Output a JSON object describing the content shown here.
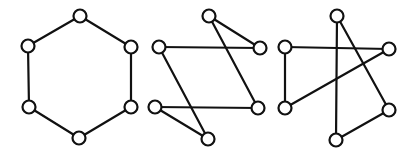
{
  "figure": {
    "colors": {
      "stroke": "#111111",
      "node_fill": "#ffffff",
      "background": "#ffffff"
    },
    "node_radius": 6.5,
    "graphs": [
      {
        "id": "hexagon",
        "nodes": [
          {
            "id": "a",
            "x": 80,
            "y": 16
          },
          {
            "id": "b",
            "x": 131,
            "y": 47
          },
          {
            "id": "c",
            "x": 131,
            "y": 107
          },
          {
            "id": "d",
            "x": 79,
            "y": 138
          },
          {
            "id": "e",
            "x": 29,
            "y": 107
          },
          {
            "id": "f",
            "x": 28,
            "y": 46
          }
        ],
        "edges": [
          [
            "a",
            "b"
          ],
          [
            "b",
            "c"
          ],
          [
            "c",
            "d"
          ],
          [
            "d",
            "e"
          ],
          [
            "e",
            "f"
          ],
          [
            "f",
            "a"
          ]
        ]
      },
      {
        "id": "crossed-1",
        "nodes": [
          {
            "id": "a",
            "x": 209,
            "y": 16
          },
          {
            "id": "b",
            "x": 260,
            "y": 48
          },
          {
            "id": "c",
            "x": 258,
            "y": 108
          },
          {
            "id": "d",
            "x": 208,
            "y": 139
          },
          {
            "id": "e",
            "x": 155,
            "y": 107
          },
          {
            "id": "f",
            "x": 159,
            "y": 47
          }
        ],
        "edges": [
          [
            "a",
            "b"
          ],
          [
            "b",
            "f"
          ],
          [
            "f",
            "d"
          ],
          [
            "d",
            "e"
          ],
          [
            "e",
            "c"
          ],
          [
            "c",
            "a"
          ]
        ]
      },
      {
        "id": "crossed-2",
        "nodes": [
          {
            "id": "a",
            "x": 337,
            "y": 16
          },
          {
            "id": "b",
            "x": 389,
            "y": 49
          },
          {
            "id": "c",
            "x": 389,
            "y": 110
          },
          {
            "id": "d",
            "x": 336,
            "y": 140
          },
          {
            "id": "e",
            "x": 285,
            "y": 108
          },
          {
            "id": "f",
            "x": 285,
            "y": 47
          }
        ],
        "edges": [
          [
            "a",
            "d"
          ],
          [
            "d",
            "c"
          ],
          [
            "c",
            "a"
          ],
          [
            "f",
            "b"
          ],
          [
            "b",
            "e"
          ],
          [
            "e",
            "f"
          ]
        ]
      }
    ]
  }
}
